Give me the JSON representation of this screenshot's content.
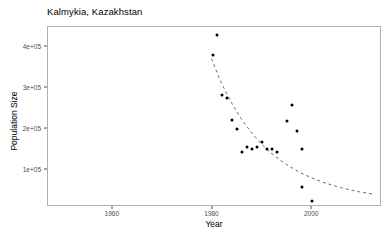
{
  "chart_data": {
    "type": "scatter",
    "title": "Kalmykia, Kazakhstan",
    "xlabel": "Year",
    "ylabel": "Population Size",
    "grid": false,
    "legend": null,
    "xlim": [
      1947,
      2014
    ],
    "ylim": [
      10000,
      448000
    ],
    "xticks": [
      1960,
      1980,
      2000
    ],
    "xtick_labels": [
      "1960",
      "1980",
      "2000"
    ],
    "yticks": [
      100000,
      200000,
      300000,
      400000
    ],
    "ytick_labels": [
      "1e+05",
      "2e+05",
      "3e+05",
      "4e+05"
    ],
    "series": [
      {
        "name": "Observed population",
        "marker": "filled-circle",
        "color": "#000000",
        "points": [
          {
            "x": 1980,
            "y": 380000
          },
          {
            "x": 1981,
            "y": 428000
          },
          {
            "x": 1982,
            "y": 282000
          },
          {
            "x": 1983,
            "y": 275000
          },
          {
            "x": 1984,
            "y": 222000
          },
          {
            "x": 1985,
            "y": 200000
          },
          {
            "x": 1986,
            "y": 143000
          },
          {
            "x": 1987,
            "y": 155000
          },
          {
            "x": 1988,
            "y": 150000
          },
          {
            "x": 1989,
            "y": 157000
          },
          {
            "x": 1990,
            "y": 168000
          },
          {
            "x": 1991,
            "y": 152000
          },
          {
            "x": 1992,
            "y": 150000
          },
          {
            "x": 1993,
            "y": 143000
          },
          {
            "x": 1995,
            "y": 220000
          },
          {
            "x": 1996,
            "y": 258000
          },
          {
            "x": 1997,
            "y": 196000
          },
          {
            "x": 1998,
            "y": 150000
          },
          {
            "x": 1998,
            "y": 58000
          },
          {
            "x": 2000,
            "y": 25000
          }
        ]
      }
    ],
    "fit_curve": {
      "name": "exponential decline fit",
      "style": "dashed",
      "color": "#555555",
      "points": [
        {
          "x": 1980,
          "y": 370000
        },
        {
          "x": 1982,
          "y": 310000
        },
        {
          "x": 1984,
          "y": 262000
        },
        {
          "x": 1986,
          "y": 222000
        },
        {
          "x": 1988,
          "y": 189000
        },
        {
          "x": 1990,
          "y": 161000
        },
        {
          "x": 1992,
          "y": 138000
        },
        {
          "x": 1994,
          "y": 119000
        },
        {
          "x": 1996,
          "y": 103000
        },
        {
          "x": 1998,
          "y": 89000
        },
        {
          "x": 2000,
          "y": 78000
        },
        {
          "x": 2002,
          "y": 68000
        },
        {
          "x": 2004,
          "y": 60000
        },
        {
          "x": 2006,
          "y": 53000
        },
        {
          "x": 2008,
          "y": 47000
        },
        {
          "x": 2010,
          "y": 42000
        },
        {
          "x": 2012,
          "y": 38000
        },
        {
          "x": 2013,
          "y": 36000
        }
      ]
    }
  }
}
